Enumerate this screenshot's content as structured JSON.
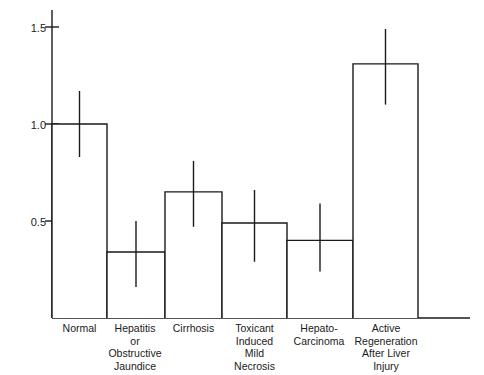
{
  "chart_data": {
    "type": "bar",
    "title": "",
    "xlabel": "",
    "ylabel": "Relative Biotransformation Ability",
    "ylim": [
      0,
      1.6
    ],
    "grid": false,
    "legend": null,
    "ytick_labels": [
      "1.5",
      "1.0",
      "0.5"
    ],
    "ytick_values": [
      1.5,
      1.0,
      0.5
    ],
    "categories": [
      "Normal",
      "Hepatitis\nor\nObstructive\nJaundice",
      "Cirrhosis",
      "Toxicant\nInduced\nMild\nNecrosis",
      "Hepato-\nCarcinoma",
      "Active\nRegeneration\nAfter Liver\nInjury"
    ],
    "values": [
      1.0,
      0.34,
      0.65,
      0.49,
      0.4,
      1.31
    ],
    "error_low": [
      0.83,
      0.16,
      0.47,
      0.29,
      0.24,
      1.1
    ],
    "error_high": [
      1.17,
      0.5,
      0.81,
      0.66,
      0.59,
      1.49
    ],
    "series": [
      {
        "name": "Relative Biotransformation Ability",
        "values": [
          1.0,
          0.34,
          0.65,
          0.49,
          0.4,
          1.31
        ]
      }
    ],
    "style": {
      "bar_fill": "#ffffff",
      "bar_stroke": "#1a1a1a",
      "axis_color": "#1a1a1a",
      "error_color": "#1a1a1a"
    }
  },
  "axes": {
    "y_axis_label": "Relative Biotransformation Ability"
  }
}
